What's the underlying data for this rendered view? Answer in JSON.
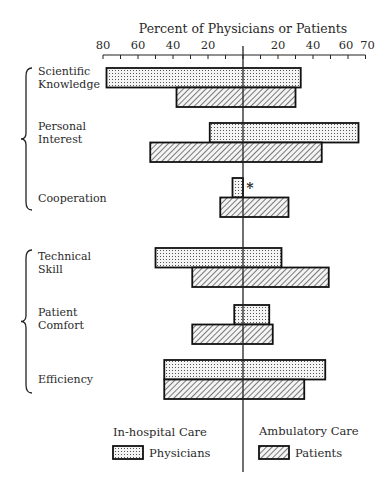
{
  "chart_data": {
    "type": "bar",
    "subtype": "diverging-horizontal-bar",
    "title": "Percent of Physicians or Patients",
    "xlabel": "Percent of Physicians or Patients",
    "ylabel": "",
    "axis": {
      "left_ticks": [
        "80",
        "60",
        "40",
        "20"
      ],
      "right_ticks": [
        "20",
        "40",
        "60",
        "70"
      ],
      "left_range": [
        0,
        80
      ],
      "right_range": [
        0,
        70
      ],
      "tick_step": 10
    },
    "sides": {
      "left": "In-hospital Care",
      "right": "Ambulatory Care"
    },
    "categories": [
      "Scientific Knowledge",
      "Personal Interest",
      "Cooperation",
      "Technical Skill",
      "Patient Comfort",
      "Efficiency"
    ],
    "category_lines": [
      [
        "Scientific",
        "Knowledge"
      ],
      [
        "Personal",
        "Interest"
      ],
      [
        "Cooperation"
      ],
      [
        "Technical",
        "Skill"
      ],
      [
        "Patient",
        "Comfort"
      ],
      [
        "Efficiency"
      ]
    ],
    "groups": [
      {
        "members": [
          "Scientific Knowledge",
          "Personal Interest",
          "Cooperation"
        ]
      },
      {
        "members": [
          "Technical Skill",
          "Patient Comfort",
          "Efficiency"
        ]
      }
    ],
    "series": [
      {
        "name": "Physicians",
        "pattern": "dots",
        "in_hospital": [
          78,
          19,
          6,
          50,
          5,
          45
        ],
        "ambulatory": [
          33,
          66,
          0,
          22,
          15,
          47
        ]
      },
      {
        "name": "Patients",
        "pattern": "diagonal-hatch",
        "in_hospital": [
          38,
          53,
          13,
          29,
          29,
          45
        ],
        "ambulatory": [
          30,
          45,
          26,
          49,
          17,
          35
        ]
      }
    ],
    "annotations": [
      {
        "category": "Cooperation",
        "series": "Physicians",
        "side": "ambulatory",
        "text": "*"
      }
    ],
    "legend": {
      "position": "bottom",
      "left_heading": "In-hospital Care",
      "right_heading": "Ambulatory Care",
      "items": [
        {
          "label": "Physicians",
          "pattern": "dots"
        },
        {
          "label": "Patients",
          "pattern": "diagonal-hatch"
        }
      ]
    },
    "grid": false
  }
}
